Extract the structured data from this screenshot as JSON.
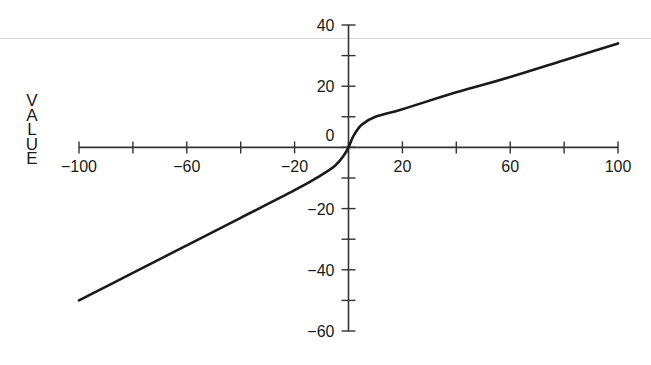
{
  "chart_data": {
    "type": "line",
    "title": "",
    "xlabel": "",
    "ylabel": "VALUE",
    "xlim": [
      -100,
      100
    ],
    "ylim": [
      -60,
      40
    ],
    "grid": false,
    "legend": null,
    "x_ticks_major_labeled": [
      -100,
      -60,
      -20,
      20,
      60,
      100
    ],
    "x_ticks_all": [
      -100,
      -80,
      -60,
      -40,
      -20,
      0,
      20,
      40,
      60,
      80,
      100
    ],
    "y_ticks_major_labeled": [
      40,
      20,
      0,
      -20,
      -40,
      -60
    ],
    "y_ticks_all": [
      40,
      30,
      20,
      10,
      0,
      -10,
      -20,
      -30,
      -40,
      -50,
      -60
    ],
    "series": [
      {
        "name": "value",
        "x": [
          -100,
          -80,
          -60,
          -40,
          -20,
          -10,
          -5,
          -2,
          0,
          2,
          5,
          10,
          20,
          40,
          60,
          80,
          100
        ],
        "y": [
          -50,
          -41,
          -32,
          -23,
          -14,
          -9,
          -6,
          -3,
          0,
          4,
          7.5,
          10,
          12.5,
          18,
          23,
          28.5,
          34
        ]
      }
    ]
  },
  "axis": {
    "ylabel_letters": [
      "V",
      "A",
      "L",
      "U",
      "E"
    ],
    "x_labels": [
      "−100",
      "−60",
      "−20",
      "20",
      "60",
      "100"
    ],
    "y_labels": [
      "40",
      "20",
      "0",
      "−20",
      "−40",
      "−60"
    ]
  },
  "colors": {
    "line": "#1a1a1a",
    "axis": "#333333",
    "background": "#ffffff"
  }
}
